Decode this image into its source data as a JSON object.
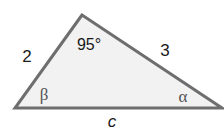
{
  "diagram": {
    "type": "triangle",
    "colors": {
      "fill": "#f2f2f2",
      "stroke": "#6e6e6e",
      "text": "#1a1a1a",
      "greek": "#555555"
    },
    "vertices": {
      "top": [
        82,
        15
      ],
      "bottom_left": [
        15,
        108
      ],
      "bottom_right": [
        222,
        108
      ]
    },
    "labels": {
      "left_side": "2",
      "right_side": "3",
      "bottom_side": "c",
      "top_angle": "95°",
      "left_angle": "β",
      "right_angle": "α"
    }
  }
}
